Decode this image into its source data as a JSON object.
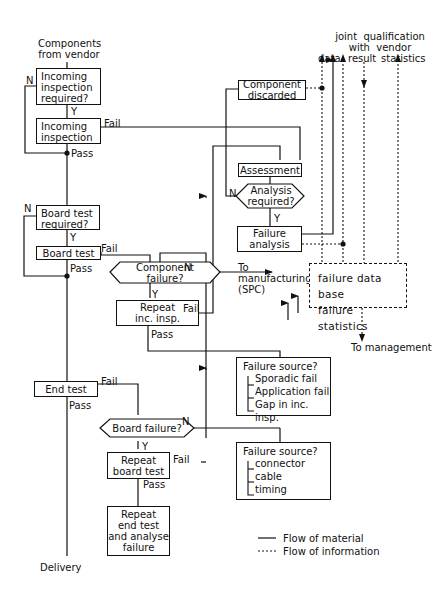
{
  "top_labels": {
    "source": "Components\nfrom vendor",
    "joint_qualification": "joint  qualification\nwith  vendor",
    "data": "data",
    "result": "result",
    "statistics": "statistics"
  },
  "left_column": {
    "incoming_required": "Incoming\ninspection\nrequired?",
    "incoming_inspection": "Incoming\ninspection",
    "board_required": "Board test\nrequired?",
    "board_test": "Board test",
    "end_test": "End test",
    "delivery": "Delivery"
  },
  "middle": {
    "component_failure": "Component\nfailure?",
    "repeat_inc_insp": "Repeat\ninc. insp.",
    "board_failure": "Board failure?",
    "repeat_board_test": "Repeat\nboard test",
    "repeat_end_test": "Repeat\nend test\nand analyse\nfailure"
  },
  "right": {
    "component_discarded": "Component\ndiscarded",
    "assessment": "Assessment",
    "analysis_required": "Analysis\nrequired?",
    "failure_analysis": "Failure\nanalysis",
    "to_manufacturing": "To\nmanufacturing\n(SPC)",
    "database_line1": "failure data base",
    "database_line2": "failure statistics",
    "to_management": "To management"
  },
  "failure_sources": [
    {
      "title": "Failure source?",
      "items": [
        "Sporadic fail",
        "Application fail",
        "Gap in inc. insp."
      ]
    },
    {
      "title": "Failure source?",
      "items": [
        "connector",
        "cable",
        "timing"
      ]
    }
  ],
  "edge_labels": {
    "yes": "Y",
    "no": "N",
    "pass": "Pass",
    "fail": "Fail"
  },
  "legend": {
    "material": "Flow  of  material",
    "information": "Flow  of  information"
  }
}
